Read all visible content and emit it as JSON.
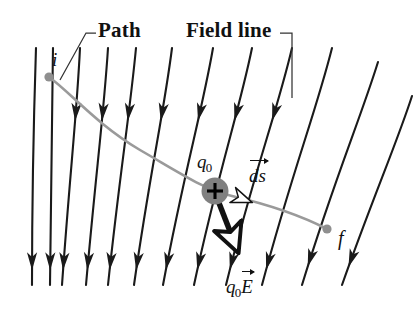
{
  "figure": {
    "background": "#ffffff",
    "width": 413,
    "height": 315
  },
  "colors": {
    "field_line": "#1a1a1a",
    "path": "#9a9a9a",
    "charge_fill": "#808080",
    "charge_symbol": "#000000",
    "force_arrow": "#111111",
    "arrowhead_hollow_fill": "#ffffff",
    "label_text": "#111111",
    "leader_line": "#333333"
  },
  "labels": {
    "path": "Path",
    "field_line": "Field line",
    "initial_point": "i",
    "final_point": "f",
    "charge": "q",
    "charge_subscript": "0",
    "displacement": "ds",
    "force_charge": "q",
    "force_subscript": "0",
    "force_field": "E"
  },
  "chart_data": {
    "type": "diagram",
    "field_lines": [
      {
        "id": 1,
        "path": "M 36,48 C 34,110 32,170 32,285",
        "arrows": [
          {
            "t": 0.9
          }
        ]
      },
      {
        "id": 2,
        "path": "M 53,48 C 52,112 51,172 50,285",
        "arrows": [
          {
            "t": 0.9
          }
        ]
      },
      {
        "id": 3,
        "path": "M 80,48 C 77,112 70,172 62,285",
        "arrows": [
          {
            "t": 0.27
          },
          {
            "t": 0.9
          }
        ]
      },
      {
        "id": 4,
        "path": "M 108,48 C 104,112 96,172 86,285",
        "arrows": [
          {
            "t": 0.27
          },
          {
            "t": 0.9
          }
        ]
      },
      {
        "id": 5,
        "path": "M 136,48 C 130,112 120,172 108,285",
        "arrows": [
          {
            "t": 0.27
          },
          {
            "t": 0.9
          }
        ]
      },
      {
        "id": 6,
        "path": "M 172,48 C 164,112 150,172 134,285",
        "arrows": [
          {
            "t": 0.27
          },
          {
            "t": 0.9
          }
        ]
      },
      {
        "id": 7,
        "path": "M 213,48 C 202,112 184,172 163,285",
        "arrows": [
          {
            "t": 0.27
          },
          {
            "t": 0.9
          }
        ]
      },
      {
        "id": 8,
        "path": "M 252,48 C 239,112 218,172 194,285",
        "arrows": [
          {
            "t": 0.27
          },
          {
            "t": 0.9
          }
        ]
      },
      {
        "id": 9,
        "path": "M 292,48 C 277,112 254,172 226,285",
        "arrows": [
          {
            "t": 0.27
          },
          {
            "t": 0.9
          }
        ]
      },
      {
        "id": 10,
        "path": "M 332,48 C 316,112 292,172 262,285",
        "arrows": [
          {
            "t": 0.9
          }
        ]
      },
      {
        "id": 11,
        "path": "M 378,62 C 360,120 334,180 302,285",
        "arrows": [
          {
            "t": 0.88
          }
        ]
      },
      {
        "id": 12,
        "path": "M 412,96 C 398,140 372,200 342,285",
        "arrows": [
          {
            "t": 0.86
          }
        ]
      }
    ],
    "particle_path": {
      "d": "M 49,77 C 70,92 96,124 140,150 C 180,173 205,190 232,196 C 270,205 300,215 327,229",
      "stroke": "#9a9a9a",
      "width": 2.6
    },
    "initial_marker": {
      "x": 49,
      "y": 77,
      "r": 4.6
    },
    "final_marker": {
      "x": 327,
      "y": 229,
      "r": 4.6
    },
    "charge": {
      "x": 215,
      "y": 191,
      "r": 13.5
    },
    "displacement_arrow": {
      "x": 243,
      "y": 199,
      "angle_deg": 21
    },
    "force_arrow": {
      "from_x": 219,
      "from_y": 203,
      "to_x": 240,
      "to_y": 257,
      "width": 5.5
    },
    "leaders": {
      "path": "M 96,33 L 86,33 L 60,80",
      "field_line": "M 280,33 L 292,33 L 292,98"
    }
  },
  "label_positions": {
    "path": {
      "left": 98,
      "top": 20
    },
    "field_line": {
      "left": 186,
      "top": 20
    },
    "initial_point": {
      "left": 52,
      "top": 50
    },
    "final_point": {
      "left": 338,
      "top": 228
    },
    "charge": {
      "left": 197,
      "top": 152
    },
    "displacement": {
      "left": 249,
      "top": 166
    },
    "force": {
      "left": 226,
      "top": 277
    }
  }
}
